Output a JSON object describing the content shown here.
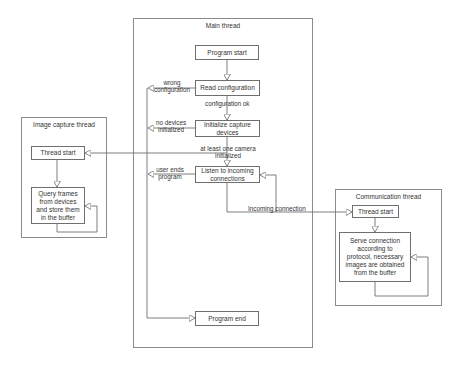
{
  "diagram": {
    "type": "flowchart",
    "frames": {
      "main": {
        "title": "Main thread"
      },
      "image_capture": {
        "title": "Image capture thread"
      },
      "communication": {
        "title": "Communication thread"
      }
    },
    "main_nodes": {
      "program_start": "Program start",
      "read_configuration": "Read configuration",
      "initialize_capture": "Initialize capture devices",
      "listen": "Listen to incoming connections",
      "program_end": "Program end"
    },
    "image_capture_nodes": {
      "thread_start": "Thread start",
      "query_frames": "Query frames from devices and store them in the buffer"
    },
    "communication_nodes": {
      "thread_start": "Thread start",
      "serve_connection": "Serve connection according to protocol, necessary images are obtained from the buffer"
    },
    "edge_labels": {
      "wrong_configuration": "wrong configuration",
      "configuration_ok": "configuration ok",
      "no_devices": "no devices initialized",
      "at_least_one_camera": "at least one camera initialized",
      "user_ends": "user ends program",
      "incoming_connection": "Incoming connection"
    },
    "colors": {
      "line": "#6f6f6f",
      "frame_border": "#8a8a8a",
      "text": "#333333",
      "background": "#ffffff"
    }
  }
}
